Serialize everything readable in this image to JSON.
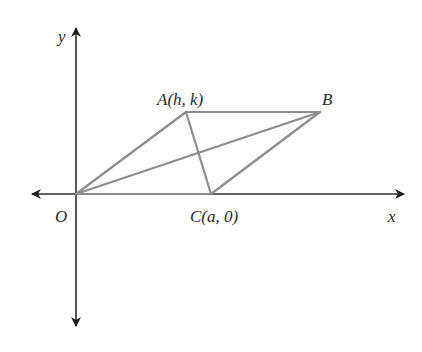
{
  "diagram": {
    "type": "parallelogram-on-coordinate-plane",
    "axes": {
      "x_label": "x",
      "y_label": "y",
      "origin_label": "O",
      "color": "#2e2e2e"
    },
    "points": {
      "O": {
        "label": "O",
        "px": [
          76,
          194
        ]
      },
      "A": {
        "label_name": "A",
        "label_coords": "(h, k)",
        "px": [
          186,
          112
        ]
      },
      "B": {
        "label_name": "B",
        "label_coords": "",
        "px": [
          320,
          112
        ]
      },
      "C": {
        "label_name": "C",
        "label_coords": "(a, 0)",
        "px": [
          211,
          194
        ]
      }
    },
    "segments": [
      {
        "name": "OA",
        "from": "O",
        "to": "A"
      },
      {
        "name": "AB",
        "from": "A",
        "to": "B"
      },
      {
        "name": "BC",
        "from": "B",
        "to": "C"
      },
      {
        "name": "OC",
        "from": "O",
        "to": "C"
      },
      {
        "name": "diagonal-OB",
        "from": "O",
        "to": "B"
      },
      {
        "name": "diagonal-AC",
        "from": "A",
        "to": "C"
      }
    ],
    "shape_color": "#8c8c8c"
  }
}
